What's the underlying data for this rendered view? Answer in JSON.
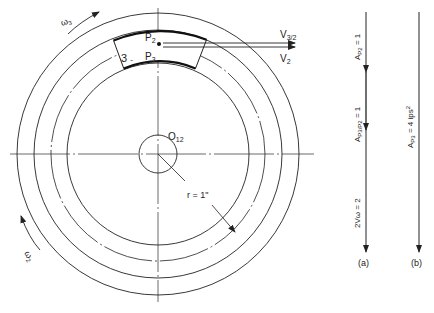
{
  "disk": {
    "center_label": "O",
    "center_sub": "12",
    "slider_label": "3",
    "point_p2": "P",
    "point_p2_sub": "2",
    "point_p3": "P",
    "point_p3_sub": "3",
    "omega3": "ω",
    "omega3_sub": "3",
    "omega2": "ω",
    "omega2_sub": "2",
    "radius_label": "r = 1\""
  },
  "velocities": {
    "v32": "V",
    "v32_sub": "3/2",
    "v2": "V",
    "v2_sub": "2"
  },
  "diagram_a": {
    "caption": "(a)",
    "seg1_label": "A",
    "seg1_sup": "n",
    "seg1_sub": "P2",
    "seg1_value": " = 1",
    "seg2_label": "A",
    "seg2_sup": "n",
    "seg2_sub": "P3/P2",
    "seg2_value": " = 1",
    "seg3_label": "2Vω = 2"
  },
  "diagram_b": {
    "caption": "(b)",
    "label": "A",
    "label_sub": "P3",
    "value": " = 4 ips",
    "value_sup": "2"
  }
}
